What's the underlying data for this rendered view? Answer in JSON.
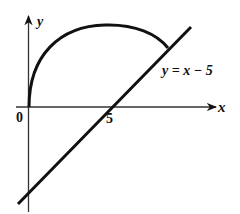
{
  "diagram": {
    "type": "coordinate-graph",
    "axes": {
      "x_label": "x",
      "y_label": "y",
      "origin_label": "0"
    },
    "tick_labels": [
      {
        "value": "5",
        "axis": "x"
      }
    ],
    "curves": [
      {
        "name": "semicircle-arc",
        "description": "upper arc from origin curving up and right"
      },
      {
        "name": "line",
        "equation": "y = x − 5"
      }
    ],
    "line_label": "y = x − 5",
    "colors": {
      "stroke": "#111111",
      "axis": "#333333",
      "background": "#ffffff"
    }
  }
}
